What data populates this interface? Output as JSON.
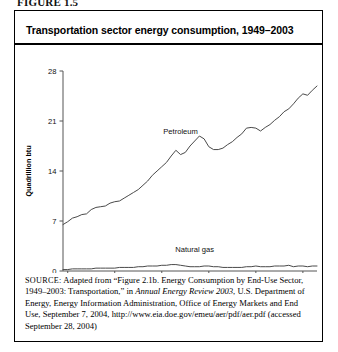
{
  "figure": {
    "label": "FIGURE 1.5"
  },
  "panel": {
    "title": "Transportation sector energy consumption, 1949–2003"
  },
  "source": {
    "prefix": "SOURCE:",
    "text_part1": " Adapted from “Figure 2.1b. Energy Consumption by End-Use Sector, 1949–2003: Transportation,” in ",
    "italic_title": "Annual Energy Review 2003",
    "text_part2": ", U.S. Department of Energy, Energy Information Administration, Office of Energy Markets and End Use, September 7, 2004, http://www.eia.doe.gov/emeu/aer/pdf/aer.pdf (accessed September 28, 2004)"
  },
  "chart_data": {
    "type": "line",
    "title": "Transportation sector energy consumption, 1949–2003",
    "xlabel": "",
    "ylabel": "Quadrillion btu",
    "xlim": [
      1949,
      2003
    ],
    "ylim": [
      0,
      28
    ],
    "yticks": [
      0,
      7,
      14,
      21,
      28
    ],
    "xticks": [
      1950,
      1960,
      1970,
      1980,
      1990,
      2000
    ],
    "grid": false,
    "legend": "inline-labels",
    "annotations": [
      {
        "text": "Petroleum",
        "x": 1974,
        "y": 19.2
      },
      {
        "text": "Natural gas",
        "x": 1977,
        "y": 2.6
      }
    ],
    "x": [
      1949,
      1950,
      1951,
      1952,
      1953,
      1954,
      1955,
      1956,
      1957,
      1958,
      1959,
      1960,
      1961,
      1962,
      1963,
      1964,
      1965,
      1966,
      1967,
      1968,
      1969,
      1970,
      1971,
      1972,
      1973,
      1974,
      1975,
      1976,
      1977,
      1978,
      1979,
      1980,
      1981,
      1982,
      1983,
      1984,
      1985,
      1986,
      1987,
      1988,
      1989,
      1990,
      1991,
      1992,
      1993,
      1994,
      1995,
      1996,
      1997,
      1998,
      1999,
      2000,
      2001,
      2002,
      2003
    ],
    "series": [
      {
        "name": "Petroleum",
        "values": [
          6.5,
          6.9,
          7.4,
          7.6,
          7.9,
          8.0,
          8.6,
          8.9,
          9.0,
          9.1,
          9.5,
          9.7,
          9.8,
          10.2,
          10.6,
          11.0,
          11.4,
          12.0,
          12.6,
          13.4,
          14.0,
          14.6,
          15.2,
          16.1,
          16.9,
          16.3,
          16.6,
          17.5,
          18.2,
          18.9,
          18.5,
          17.4,
          17.0,
          17.0,
          17.2,
          17.7,
          18.1,
          18.7,
          19.2,
          20.0,
          20.1,
          20.0,
          19.6,
          20.1,
          20.5,
          21.1,
          21.6,
          22.3,
          22.7,
          23.4,
          24.2,
          24.8,
          24.6,
          25.3,
          25.9
        ]
      },
      {
        "name": "Natural gas",
        "values": [
          0.2,
          0.2,
          0.3,
          0.3,
          0.3,
          0.3,
          0.3,
          0.4,
          0.4,
          0.4,
          0.4,
          0.4,
          0.5,
          0.5,
          0.5,
          0.5,
          0.6,
          0.6,
          0.7,
          0.7,
          0.7,
          0.8,
          0.8,
          0.9,
          0.9,
          0.8,
          0.7,
          0.6,
          0.6,
          0.6,
          0.7,
          0.7,
          0.6,
          0.6,
          0.5,
          0.5,
          0.5,
          0.5,
          0.5,
          0.6,
          0.6,
          0.7,
          0.6,
          0.6,
          0.6,
          0.7,
          0.7,
          0.7,
          0.8,
          0.6,
          0.7,
          0.7,
          0.6,
          0.7,
          0.7
        ]
      }
    ]
  }
}
